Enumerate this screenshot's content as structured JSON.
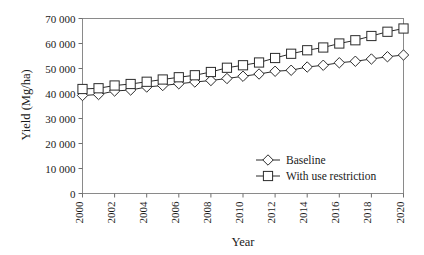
{
  "figure": {
    "background": "#ffffff",
    "frame_color": "#8a8a8a",
    "line_color": "#2b2b2b",
    "marker_fill": "#ffffff"
  },
  "chart_data": {
    "type": "line",
    "title": "",
    "xlabel": "Year",
    "ylabel": "Yield (Mg/ha)",
    "x": [
      2000,
      2001,
      2002,
      2003,
      2004,
      2005,
      2006,
      2007,
      2008,
      2009,
      2010,
      2011,
      2012,
      2013,
      2014,
      2015,
      2016,
      2017,
      2018,
      2019,
      2020
    ],
    "xlim": [
      2000,
      2020
    ],
    "ylim": [
      0,
      70000
    ],
    "yticks": [
      0,
      10000,
      20000,
      30000,
      40000,
      50000,
      60000,
      70000
    ],
    "ytick_labels": [
      "0",
      "10 000",
      "20 000",
      "30 000",
      "40 000",
      "50 000",
      "60 000",
      "70 000"
    ],
    "xticks": [
      2000,
      2002,
      2004,
      2006,
      2008,
      2010,
      2012,
      2014,
      2016,
      2018,
      2020
    ],
    "xtick_labels": [
      "2000",
      "2002",
      "2004",
      "2006",
      "2008",
      "2010",
      "2012",
      "2014",
      "2016",
      "2018",
      "2020"
    ],
    "xtick_rotation": 90,
    "grid": false,
    "legend_position": "lower right",
    "series": [
      {
        "name": "Baseline",
        "marker": "diamond",
        "values": [
          39200,
          39600,
          41000,
          41400,
          42600,
          43200,
          43900,
          44600,
          45200,
          46000,
          46900,
          47800,
          48900,
          49300,
          50600,
          51300,
          52300,
          52900,
          53800,
          54700,
          55400
        ]
      },
      {
        "name": "With use restriction",
        "marker": "square",
        "values": [
          41800,
          42100,
          43200,
          43800,
          44700,
          45600,
          46500,
          47300,
          48600,
          50300,
          51300,
          52400,
          54200,
          55900,
          57300,
          58400,
          60000,
          61300,
          63000,
          64700,
          66000
        ]
      }
    ]
  },
  "legend": {
    "items": [
      {
        "label": "Baseline",
        "marker": "diamond"
      },
      {
        "label": "With use restriction",
        "marker": "square"
      }
    ]
  }
}
